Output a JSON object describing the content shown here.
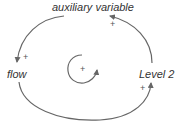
{
  "diagram": {
    "type": "causal-loop",
    "nodes": [
      {
        "id": "aux",
        "label": "auxiliary variable"
      },
      {
        "id": "flow",
        "label": "flow"
      },
      {
        "id": "level2",
        "label": "Level 2"
      }
    ],
    "links": [
      {
        "from": "auxiliary variable",
        "to": "flow",
        "polarity": "+"
      },
      {
        "from": "flow",
        "to": "Level 2",
        "polarity": "+"
      },
      {
        "from": "Level 2",
        "to": "auxiliary variable",
        "polarity": "+"
      }
    ],
    "loop": {
      "polarity": "+"
    },
    "colors": {
      "arrow": "#666666",
      "text": "#333333"
    }
  }
}
